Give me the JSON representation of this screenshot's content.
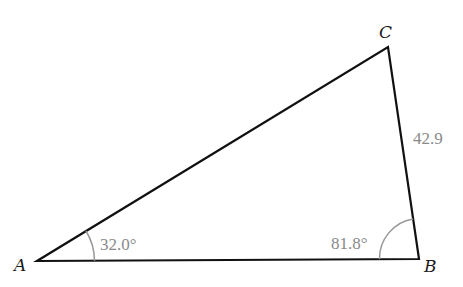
{
  "diagram": {
    "type": "triangle",
    "vertices": [
      {
        "name": "A",
        "x": 37,
        "y": 261
      },
      {
        "name": "B",
        "x": 419,
        "y": 259
      },
      {
        "name": "C",
        "x": 388,
        "y": 47
      }
    ],
    "angles": [
      {
        "vertex": "A",
        "label": "32.0°"
      },
      {
        "vertex": "B",
        "label": "81.8°"
      }
    ],
    "sides": [
      {
        "between": "BC",
        "label": "42.9"
      }
    ],
    "colors": {
      "lines": "#111111",
      "measurements": "#8a8a8a"
    }
  }
}
